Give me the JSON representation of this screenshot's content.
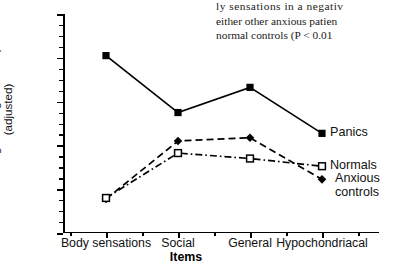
{
  "article_text": {
    "lines": [
      "ly  sensations  in  a  negativ",
      "either other anxious patien",
      "normal controls (P < 0.01"
    ]
  },
  "chart_data": {
    "type": "line",
    "title": "",
    "xlabel": "Items",
    "ylabel": "Mean rankings for negative interpretations (adjusted)",
    "ylabel_line1": "Mean rankings for negative interpretations",
    "ylabel_line2": "(adjusted)",
    "categories": [
      "Body sensations",
      "Social",
      "General",
      "Hypochondriacal"
    ],
    "ylim": [
      1.0,
      2.0
    ],
    "ytick_labels": [
      "2.0",
      "1.8",
      "1.6",
      "1.4",
      "1.2",
      "1.0"
    ],
    "ytick_values": [
      2.0,
      1.8,
      1.6,
      1.4,
      1.2,
      1.0
    ],
    "yminor_step": 0.05,
    "grid": false,
    "legend_position": "inline-right",
    "series": [
      {
        "name": "Panics",
        "values": [
          1.81,
          1.55,
          1.665,
          1.455
        ],
        "marker": "filled-square",
        "linestyle": "solid",
        "color": "#000000"
      },
      {
        "name": "Anxious controls",
        "values": [
          1.155,
          1.42,
          1.435,
          1.245
        ],
        "marker": "filled-diamond",
        "linestyle": "dashed",
        "color": "#000000"
      },
      {
        "name": "Normals",
        "values": [
          1.16,
          1.365,
          1.34,
          1.305
        ],
        "marker": "open-square",
        "linestyle": "dash-dot",
        "color": "#000000"
      }
    ]
  },
  "legend": {
    "panics": "Panics",
    "normals": "Normals",
    "anxious_line1": "Anxious",
    "anxious_line2": "controls"
  }
}
